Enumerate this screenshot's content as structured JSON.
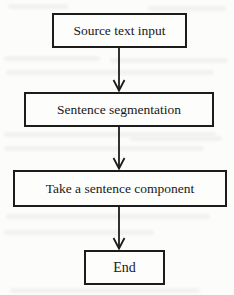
{
  "diagram": {
    "type": "flowchart",
    "orientation": "top-to-bottom",
    "background_color": "#fcfcfb",
    "stroke_color": "#1c1c1c",
    "text_color": "#181818",
    "nodes": [
      {
        "id": "source",
        "label": "Source text input",
        "shape": "rectangle"
      },
      {
        "id": "segment",
        "label": "Sentence segmentation",
        "shape": "rectangle"
      },
      {
        "id": "component",
        "label": "Take a sentence component",
        "shape": "rectangle"
      },
      {
        "id": "end",
        "label": "End",
        "shape": "rectangle"
      }
    ],
    "edges": [
      {
        "from": "source",
        "to": "segment",
        "label": "",
        "arrowhead": "open-v"
      },
      {
        "from": "segment",
        "to": "component",
        "label": "",
        "arrowhead": "open-v"
      },
      {
        "from": "component",
        "to": "end",
        "label": "",
        "arrowhead": "open-v"
      }
    ]
  }
}
